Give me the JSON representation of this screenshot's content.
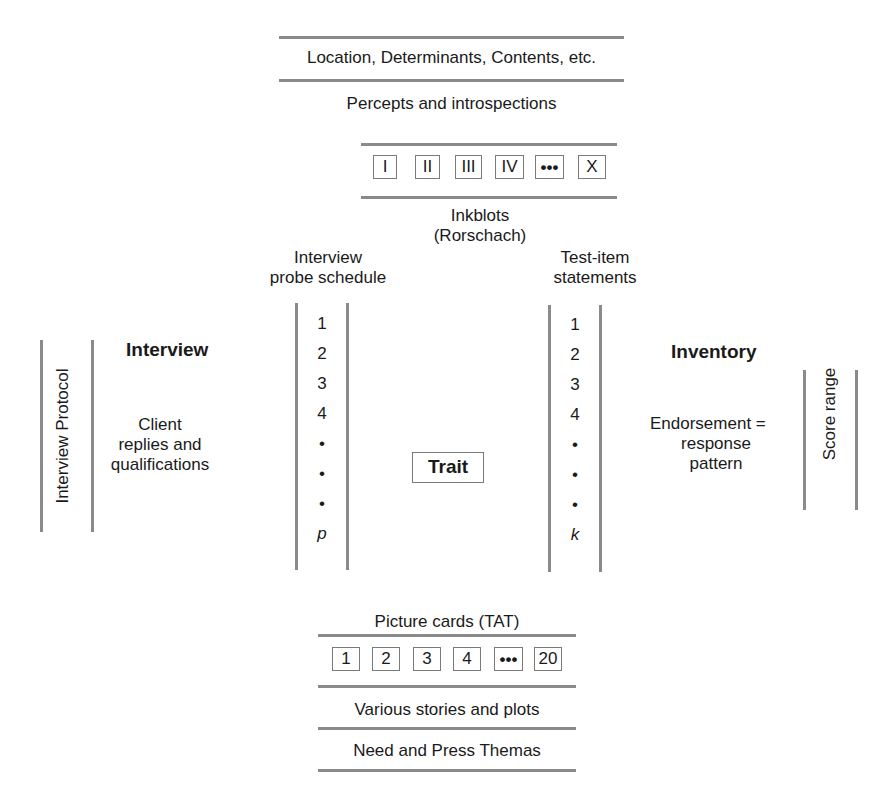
{
  "top_cutoff_text": "...quality of personality trait assessment methods (each approach)",
  "rorschach": {
    "scoring_label": "Location, Determinants, Contents, etc.",
    "response_label": "Percepts and introspections",
    "cards": [
      "I",
      "II",
      "III",
      "IV",
      "•••",
      "X"
    ],
    "stimulus_label_line1": "Inkblots",
    "stimulus_label_line2": "(Rorschach)"
  },
  "interview": {
    "schedule_label_line1": "Interview",
    "schedule_label_line2": "probe schedule",
    "items": [
      "1",
      "2",
      "3",
      "4",
      "•",
      "•",
      "•",
      "p"
    ],
    "method_label": "Interview",
    "response_line1": "Client",
    "response_line2": "replies and",
    "response_line3": "qualifications",
    "protocol_label": "Interview  Protocol"
  },
  "center": {
    "trait_label": "Trait"
  },
  "inventory": {
    "schedule_label_line1": "Test-item",
    "schedule_label_line2": "statements",
    "items": [
      "1",
      "2",
      "3",
      "4",
      "•",
      "•",
      "•",
      "k"
    ],
    "method_label": "Inventory",
    "response_line1": "Endorsement =",
    "response_line2": "response",
    "response_line3": "pattern",
    "score_label": "Score range"
  },
  "tat": {
    "stimulus_label": "Picture cards (TAT)",
    "cards": [
      "1",
      "2",
      "3",
      "4",
      "•••",
      "20"
    ],
    "response_label": "Various stories and plots",
    "scoring_label": "Need and Press Themas"
  }
}
